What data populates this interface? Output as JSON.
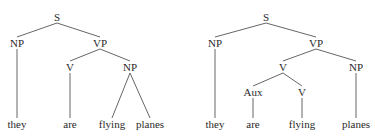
{
  "diagram": {
    "type": "syntax-tree-pair",
    "colors": {
      "text": "#2a2a2a",
      "edge": "#555555",
      "background": "#ffffff"
    },
    "trees": [
      {
        "id": "left",
        "description": "they are [NP flying planes]",
        "nodes": [
          {
            "id": "S",
            "label": "S",
            "x": 57,
            "y": 17
          },
          {
            "id": "NP1",
            "label": "NP",
            "x": 17,
            "y": 43
          },
          {
            "id": "VP",
            "label": "VP",
            "x": 100,
            "y": 43
          },
          {
            "id": "V",
            "label": "V",
            "x": 70,
            "y": 67
          },
          {
            "id": "NP2",
            "label": "NP",
            "x": 130,
            "y": 67
          },
          {
            "id": "w1",
            "label": "they",
            "x": 17,
            "y": 124
          },
          {
            "id": "w2",
            "label": "are",
            "x": 70,
            "y": 124
          },
          {
            "id": "w3",
            "label": "flying",
            "x": 112,
            "y": 124
          },
          {
            "id": "w4",
            "label": "planes",
            "x": 150,
            "y": 124
          }
        ],
        "edges": [
          [
            "S",
            "NP1"
          ],
          [
            "S",
            "VP"
          ],
          [
            "VP",
            "V"
          ],
          [
            "VP",
            "NP2"
          ],
          [
            "NP1",
            "w1"
          ],
          [
            "V",
            "w2"
          ],
          [
            "NP2",
            "w3"
          ],
          [
            "NP2",
            "w4"
          ]
        ]
      },
      {
        "id": "right",
        "description": "they [V are flying] planes",
        "nodes": [
          {
            "id": "S",
            "label": "S",
            "x": 266,
            "y": 17
          },
          {
            "id": "NP1",
            "label": "NP",
            "x": 215,
            "y": 43
          },
          {
            "id": "VP",
            "label": "VP",
            "x": 316,
            "y": 43
          },
          {
            "id": "V",
            "label": "V",
            "x": 283,
            "y": 67
          },
          {
            "id": "NP2",
            "label": "NP",
            "x": 356,
            "y": 67
          },
          {
            "id": "Aux",
            "label": "Aux",
            "x": 253,
            "y": 92
          },
          {
            "id": "V2",
            "label": "V",
            "x": 302,
            "y": 92
          },
          {
            "id": "w1",
            "label": "they",
            "x": 215,
            "y": 124
          },
          {
            "id": "w2",
            "label": "are",
            "x": 253,
            "y": 124
          },
          {
            "id": "w3",
            "label": "flying",
            "x": 302,
            "y": 124
          },
          {
            "id": "w4",
            "label": "planes",
            "x": 356,
            "y": 124
          }
        ],
        "edges": [
          [
            "S",
            "NP1"
          ],
          [
            "S",
            "VP"
          ],
          [
            "VP",
            "V"
          ],
          [
            "VP",
            "NP2"
          ],
          [
            "V",
            "Aux"
          ],
          [
            "V",
            "V2"
          ],
          [
            "NP1",
            "w1"
          ],
          [
            "Aux",
            "w2"
          ],
          [
            "V2",
            "w3"
          ],
          [
            "NP2",
            "w4"
          ]
        ]
      }
    ]
  }
}
